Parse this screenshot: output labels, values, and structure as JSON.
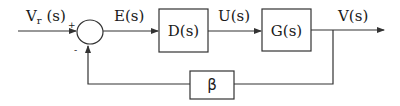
{
  "diagram": {
    "type": "feedback control block diagram",
    "signals": {
      "input": "V",
      "input_sub": "r",
      "input_suffix": " (s)",
      "error": "E(s)",
      "control": "U(s)",
      "output": "V(s)"
    },
    "summing_junction": {
      "plus_sign": "+",
      "minus_sign": "-"
    },
    "blocks": {
      "controller": "D(s)",
      "plant": "G(s)",
      "feedback": "β"
    },
    "colors": {
      "line": "#333333",
      "text": "#1a1a1a",
      "background": "#ffffff"
    }
  }
}
